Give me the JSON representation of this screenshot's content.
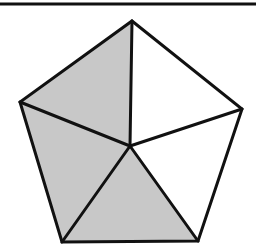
{
  "figure": {
    "top_rule": {
      "x1": 0,
      "y1": 4,
      "x2": 256,
      "y2": 4,
      "stroke_width": 3
    },
    "vertices": {
      "top": [
        132,
        21
      ],
      "right": [
        242,
        109
      ],
      "bottom_right": [
        198,
        241
      ],
      "bottom_left": [
        62,
        242
      ],
      "left": [
        20,
        102
      ],
      "center": [
        130,
        146
      ]
    },
    "triangles": [
      {
        "name": "top-left",
        "points": [
          "top",
          "center",
          "left"
        ],
        "shaded": true
      },
      {
        "name": "top-right",
        "points": [
          "top",
          "right",
          "center"
        ],
        "shaded": false
      },
      {
        "name": "right",
        "points": [
          "right",
          "bottom_right",
          "center"
        ],
        "shaded": false
      },
      {
        "name": "bottom",
        "points": [
          "bottom_right",
          "bottom_left",
          "center"
        ],
        "shaded": true
      },
      {
        "name": "left",
        "points": [
          "bottom_left",
          "left",
          "center"
        ],
        "shaded": true
      }
    ],
    "colors": {
      "shade": "#c8c8c8",
      "unshaded": "#ffffff",
      "stroke": "#111111"
    },
    "stroke_width": 3,
    "shaded_count": 3,
    "total_count": 5
  }
}
